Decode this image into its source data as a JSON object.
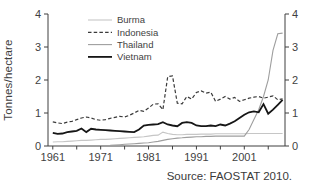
{
  "chart_data": {
    "type": "line",
    "title": "",
    "xlabel": "",
    "ylabel": "Tonnes/hectare",
    "ylim": [
      0,
      4
    ],
    "xlim": [
      1960,
      2009.5
    ],
    "y_ticks": [
      0,
      1,
      2,
      3,
      4
    ],
    "x_tick_labels": [
      1961,
      1971,
      1981,
      1991,
      2001
    ],
    "x_minor_ticks": [
      1961,
      1966,
      1971,
      1976,
      1981,
      1986,
      1991,
      1996,
      2001,
      2006
    ],
    "grid": false,
    "dual_y_axis": true,
    "legend_position": "top-left-inside",
    "series": [
      {
        "name": "Burma",
        "color": "#c6c6c6",
        "style": "solid",
        "width": 1.1,
        "start_year": 1961,
        "values": [
          0.12,
          0.13,
          0.13,
          0.14,
          0.15,
          0.16,
          0.17,
          0.17,
          0.18,
          0.19,
          0.2,
          0.2,
          0.21,
          0.22,
          0.23,
          0.24,
          0.25,
          0.26,
          0.27,
          0.28,
          0.3,
          0.32,
          0.33,
          0.42,
          0.38,
          0.35,
          0.34,
          0.34,
          0.35,
          0.35,
          0.35,
          0.36,
          0.36,
          0.36,
          0.37,
          0.37,
          0.37,
          0.37,
          0.37,
          0.37,
          0.37,
          0.38,
          0.38,
          0.38,
          0.38,
          0.38,
          0.38,
          0.38,
          0.38
        ]
      },
      {
        "name": "Indonesia",
        "color": "#3a3a3a",
        "style": "dashed",
        "width": 1.2,
        "start_year": 1961,
        "values": [
          0.73,
          0.7,
          0.68,
          0.72,
          0.75,
          0.8,
          0.85,
          0.88,
          0.85,
          0.8,
          0.78,
          0.8,
          0.84,
          0.87,
          0.9,
          0.88,
          0.93,
          1.0,
          1.08,
          1.05,
          1.15,
          1.27,
          1.28,
          1.1,
          2.1,
          2.12,
          1.3,
          1.28,
          1.5,
          1.42,
          1.62,
          1.67,
          1.6,
          1.63,
          1.35,
          1.42,
          1.5,
          1.42,
          1.47,
          1.35,
          1.4,
          1.45,
          1.48,
          1.5,
          1.45,
          1.48,
          1.52,
          1.4,
          1.43
        ]
      },
      {
        "name": "Thailand",
        "color": "#9e9e9e",
        "style": "solid",
        "width": 1.1,
        "start_year": 1973,
        "values": [
          0.02,
          0.03,
          0.04,
          0.05,
          0.06,
          0.07,
          0.08,
          0.09,
          0.1,
          0.12,
          0.14,
          0.17,
          0.2,
          0.22,
          0.24,
          0.25,
          0.26,
          0.27,
          0.28,
          0.28,
          0.29,
          0.29,
          0.3,
          0.3,
          0.3,
          0.3,
          0.3,
          0.3,
          0.3,
          0.5,
          0.8,
          1.1,
          1.5,
          2.0,
          2.9,
          3.4,
          3.42
        ]
      },
      {
        "name": "Vietnam",
        "color": "#161616",
        "style": "solid",
        "width": 1.8,
        "start_year": 1961,
        "values": [
          0.4,
          0.37,
          0.38,
          0.42,
          0.44,
          0.46,
          0.53,
          0.42,
          0.52,
          0.5,
          0.49,
          0.48,
          0.47,
          0.46,
          0.45,
          0.44,
          0.43,
          0.42,
          0.5,
          0.62,
          0.64,
          0.65,
          0.66,
          0.72,
          0.65,
          0.62,
          0.6,
          0.7,
          0.72,
          0.7,
          0.62,
          0.6,
          0.6,
          0.62,
          0.6,
          0.65,
          0.62,
          0.68,
          0.75,
          0.85,
          0.95,
          1.02,
          1.05,
          1.02,
          1.27,
          0.98,
          1.1,
          1.25,
          1.4
        ]
      }
    ],
    "axis_color": "#3f3f3f",
    "text_color": "#3f3f3f"
  },
  "source_note": "Source: FAOSTAT 2010."
}
